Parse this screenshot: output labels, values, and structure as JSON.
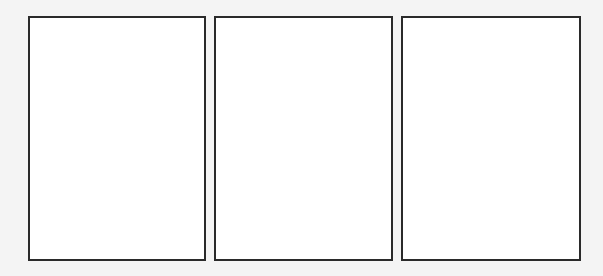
{
  "page": {
    "background_color": "#f4f4f4"
  },
  "panels": [
    {
      "id": "panel-1",
      "content": "",
      "border_color": "#2a2a2a",
      "fill": "#ffffff"
    },
    {
      "id": "panel-2",
      "content": "",
      "border_color": "#2a2a2a",
      "fill": "#ffffff"
    },
    {
      "id": "panel-3",
      "content": "",
      "border_color": "#2a2a2a",
      "fill": "#ffffff"
    }
  ]
}
